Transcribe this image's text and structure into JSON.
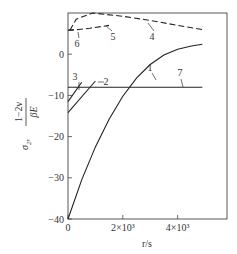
{
  "chart_data": {
    "type": "line",
    "title": "",
    "xlabel": "r/s",
    "ylabel": "σ2 · (1−2ν)/(βE)",
    "xlim": [
      0,
      5800
    ],
    "ylim": [
      -40,
      10
    ],
    "grid": false,
    "x_ticks": [
      {
        "value": 0,
        "label": "0"
      },
      {
        "value": 2000,
        "label": "2×10³"
      },
      {
        "value": 4000,
        "label": "4×10³"
      }
    ],
    "y_ticks": [
      {
        "value": 0,
        "label": "0"
      },
      {
        "value": -10,
        "label": "−10"
      },
      {
        "value": -20,
        "label": "−20"
      },
      {
        "value": -30,
        "label": "−30"
      },
      {
        "value": -40,
        "label": "−40"
      }
    ],
    "series": [
      {
        "name": "1",
        "style": "solid",
        "x": [
          0,
          500,
          1000,
          1500,
          2000,
          2500,
          3000,
          3500,
          4000,
          4500,
          4900
        ],
        "y": [
          -40,
          -30.5,
          -22.5,
          -15.8,
          -10.2,
          -5.8,
          -2.5,
          -0.2,
          1.2,
          2.0,
          2.4
        ]
      },
      {
        "name": "2",
        "style": "solid",
        "x": [
          0,
          1000
        ],
        "y": [
          -14.2,
          -6.5
        ]
      },
      {
        "name": "3",
        "style": "solid",
        "x": [
          0,
          500
        ],
        "y": [
          -11.5,
          -6.8
        ]
      },
      {
        "name": "4",
        "style": "dashed",
        "x": [
          70,
          300,
          900,
          2000,
          3000,
          4000,
          4900
        ],
        "y": [
          5.8,
          8.5,
          10,
          9.2,
          8.2,
          7.0,
          6.0
        ]
      },
      {
        "name": "5",
        "style": "dashed",
        "x": [
          0,
          400,
          800,
          1500
        ],
        "y": [
          5.8,
          6.0,
          6.3,
          7.0
        ]
      },
      {
        "name": "6",
        "style": "dashed",
        "x": [
          0,
          200
        ],
        "y": [
          5.8,
          5.9
        ]
      },
      {
        "name": "7",
        "style": "solid",
        "x": [
          0,
          4900
        ],
        "y": [
          -8,
          -8
        ]
      }
    ],
    "curve_labels": [
      "1",
      "2",
      "3",
      "4",
      "5",
      "6",
      "7"
    ]
  },
  "axes": {
    "x_title": "r/s",
    "y_title_symbol": "σ",
    "y_title_sub": "2",
    "y_title_num": "1−2ν",
    "y_title_den": "βE"
  }
}
